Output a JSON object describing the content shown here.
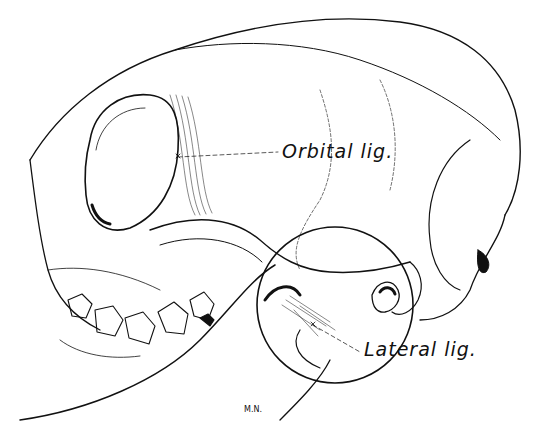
{
  "figure": {
    "labels": {
      "orbital": "Orbital lig.",
      "lateral": "Lateral lig."
    },
    "signature": "M.N.",
    "colors": {
      "ink": "#111111",
      "background": "#ffffff"
    }
  }
}
